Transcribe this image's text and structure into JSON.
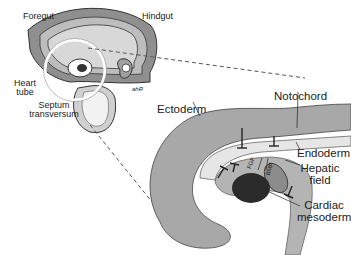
{
  "figure": {
    "overview_panel": {
      "labels": {
        "foregut": "Foregut",
        "hindgut": "Hindgut",
        "heart_tube_line1": "Heart",
        "heart_tube_line2": "tube",
        "septum_line1": "Septum",
        "septum_line2": "transversum",
        "signature": "ahR"
      }
    },
    "detail_panel": {
      "labels": {
        "ectoderm": "Ectoderm",
        "notochord": "Notochord",
        "endoderm": "Endoderm",
        "hepatic_line1": "Hepatic",
        "hepatic_line2": "field",
        "cardiac_line1": "Cardiac",
        "cardiac_line2": "mesoderm",
        "fgf": "FGF",
        "bmp": "BMP"
      }
    },
    "colors": {
      "ectoderm_fill": "#a8a8a8",
      "endoderm_fill": "#e6e6e6",
      "mesoderm_fill": "#b4b4b4",
      "cardiac_fill": "#2b2b2b",
      "hepatic_fill": "#8c8c8c",
      "line": "#222222"
    }
  }
}
